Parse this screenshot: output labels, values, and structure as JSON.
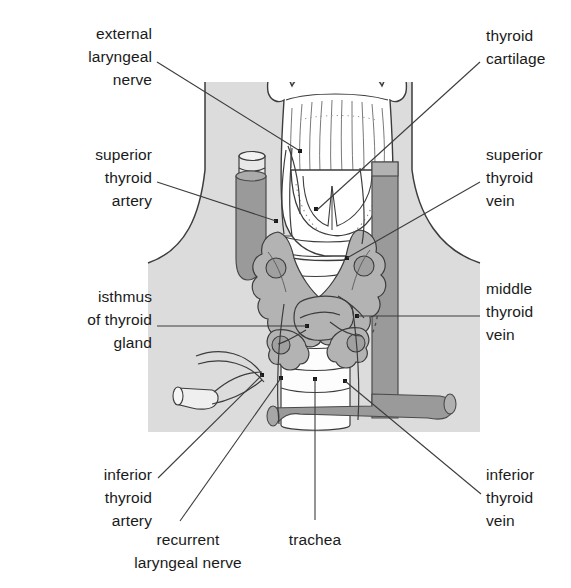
{
  "figure": {
    "width": 571,
    "height": 588,
    "background_color": "#ffffff",
    "panel_color": "#dcdcdc",
    "vessel_fill": "#9a9a9a",
    "gland_fill": "#b3b3b3",
    "line_color": "#3c3c3c",
    "text_color": "#1a1a1a"
  },
  "labels": [
    {
      "id": "external-laryngeal-nerve",
      "text": "external\nlaryngeal\nnerve",
      "align": "right",
      "x": 22,
      "y": 22,
      "width": 130,
      "leader": {
        "x1": 157,
        "y1": 62,
        "x2": 300,
        "y2": 151
      }
    },
    {
      "id": "thyroid-cartilage",
      "text": "thyroid\ncartilage",
      "align": "left",
      "x": 486,
      "y": 24,
      "width": 85,
      "leader": {
        "x1": 480,
        "y1": 62,
        "x2": 317,
        "y2": 210
      }
    },
    {
      "id": "superior-thyroid-artery",
      "text": "superior\nthyroid\nartery",
      "align": "right",
      "x": 38,
      "y": 143,
      "width": 114,
      "leader": {
        "x1": 157,
        "y1": 182,
        "x2": 276,
        "y2": 221
      }
    },
    {
      "id": "superior-thyroid-vein",
      "text": "superior\nthyroid\nvein",
      "align": "left",
      "x": 486,
      "y": 143,
      "width": 85,
      "leader": {
        "x1": 480,
        "y1": 182,
        "x2": 347,
        "y2": 258
      }
    },
    {
      "id": "isthmus-of-thyroid-gland",
      "text": "isthmus\nof thyroid\ngland",
      "align": "right",
      "x": 30,
      "y": 285,
      "width": 122,
      "leader": {
        "x1": 157,
        "y1": 326,
        "x2": 307,
        "y2": 326
      }
    },
    {
      "id": "middle-thyroid-vein",
      "text": "middle\nthyroid\nvein",
      "align": "left",
      "x": 486,
      "y": 277,
      "width": 85,
      "leader": {
        "x1": 480,
        "y1": 316,
        "x2": 357,
        "y2": 316
      }
    },
    {
      "id": "inferior-thyroid-artery",
      "text": "inferior\nthyroid\nartery",
      "align": "right",
      "x": 38,
      "y": 463,
      "width": 114,
      "leader": {
        "x1": 158,
        "y1": 478,
        "x2": 262,
        "y2": 375
      }
    },
    {
      "id": "inferior-thyroid-vein",
      "text": "inferior\nthyroid\nvein",
      "align": "left",
      "x": 486,
      "y": 463,
      "width": 85,
      "leader": {
        "x1": 481,
        "y1": 494,
        "x2": 345,
        "y2": 381
      }
    },
    {
      "id": "recurrent-laryngeal-nerve",
      "text": "recurrent\nlaryngeal nerve",
      "align": "center",
      "x": 108,
      "y": 528,
      "width": 160,
      "leader": {
        "x1": 180,
        "y1": 521,
        "x2": 281,
        "y2": 378
      }
    },
    {
      "id": "trachea",
      "text": "trachea",
      "align": "center",
      "x": 275,
      "y": 528,
      "width": 80,
      "leader": {
        "x1": 315,
        "y1": 520,
        "x2": 315,
        "y2": 379
      }
    }
  ],
  "structures": [
    {
      "id": "thyroid-cartilage",
      "label": "thyroid cartilage"
    },
    {
      "id": "trachea",
      "label": "trachea"
    },
    {
      "id": "thyroid-gland",
      "label": "thyroid gland"
    },
    {
      "id": "isthmus",
      "label": "isthmus of thyroid gland"
    },
    {
      "id": "internal-jugular-vein",
      "label": "internal jugular vein"
    },
    {
      "id": "common-carotid-artery",
      "label": "common carotid artery"
    },
    {
      "id": "inferior-thyroid-vein",
      "label": "inferior thyroid vein"
    },
    {
      "id": "recurrent-laryngeal-nerve",
      "label": "recurrent laryngeal nerve"
    }
  ]
}
